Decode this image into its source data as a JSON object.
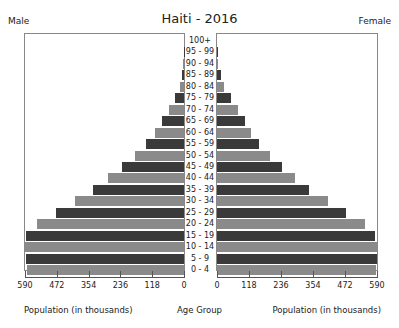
{
  "header": {
    "title": "Haiti - 2016",
    "left_label": "Male",
    "right_label": "Female"
  },
  "footer": {
    "left_axis_label": "Population (in thousands)",
    "center_label": "Age Group",
    "right_axis_label": "Population (in thousands)"
  },
  "colors": {
    "dark": "#3a3a3a",
    "light": "#8a8a8a",
    "frame": "#888888"
  },
  "chart_data": {
    "type": "bar",
    "subtype": "population-pyramid",
    "title": "Haiti - 2016",
    "xlabel": "Population (in thousands)",
    "ylabel": "Age Group",
    "xlim": [
      0,
      590
    ],
    "xticks": [
      0,
      118,
      236,
      354,
      472,
      590
    ],
    "grid": false,
    "legend": [
      "Male",
      "Female"
    ],
    "categories": [
      "100+",
      "95 - 99",
      "90 - 94",
      "85 - 89",
      "80 - 84",
      "75 - 79",
      "70 - 74",
      "65 - 69",
      "60 - 64",
      "55 - 59",
      "50 - 54",
      "45 - 49",
      "40 - 44",
      "35 - 39",
      "30 - 34",
      "25 - 29",
      "20 - 24",
      "15 - 19",
      "10 - 14",
      "5 - 9",
      "0 - 4"
    ],
    "series": [
      {
        "name": "Male",
        "values": [
          0,
          1,
          3,
          8,
          16,
          34,
          56,
          82,
          108,
          141,
          182,
          230,
          282,
          338,
          404,
          475,
          545,
          585,
          590,
          587,
          582
        ]
      },
      {
        "name": "Female",
        "values": [
          0,
          2,
          5,
          13,
          25,
          50,
          77,
          103,
          125,
          155,
          195,
          240,
          288,
          340,
          410,
          476,
          546,
          583,
          590,
          590,
          587
        ]
      }
    ]
  }
}
